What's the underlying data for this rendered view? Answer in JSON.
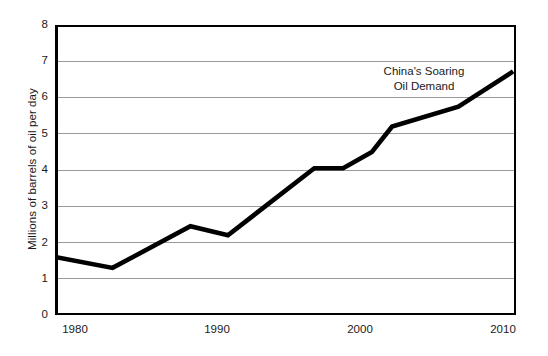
{
  "chart_data": {
    "type": "line",
    "title": "",
    "annotation": "China's Soaring Oil Demand",
    "annotation_line1": "China's Soaring",
    "annotation_line2": "Oil Demand",
    "xlabel": "",
    "ylabel": "Millions of barrels of oil per day",
    "xlim": [
      1979,
      2011
    ],
    "ylim": [
      0,
      8
    ],
    "xticks": [
      1980,
      1990,
      2000,
      2010
    ],
    "xticklabels": [
      "1980",
      "1990",
      "2000",
      "2010"
    ],
    "yticks": [
      0,
      1,
      2,
      3,
      4,
      5,
      6,
      7,
      8
    ],
    "yticklabels": [
      "0",
      "1",
      "2",
      "3",
      "4",
      "5",
      "6",
      "7",
      "8"
    ],
    "grid": "horizontal",
    "legend": "none",
    "series": [
      {
        "name": "China oil demand",
        "color": "#000000",
        "x": [
          1979.0,
          1983.0,
          1988.4,
          1991.0,
          1997.0,
          1999.0,
          2001.0,
          2002.4,
          2007.0,
          2010.8
        ],
        "values": [
          1.6,
          1.3,
          2.45,
          2.2,
          4.05,
          4.05,
          4.5,
          5.2,
          5.75,
          6.72
        ]
      }
    ]
  },
  "colors": {
    "background": "#ffffff",
    "axis": "#000000",
    "gridline": "#9a9a9a",
    "line": "#000000",
    "text": "#1a1a1a"
  }
}
